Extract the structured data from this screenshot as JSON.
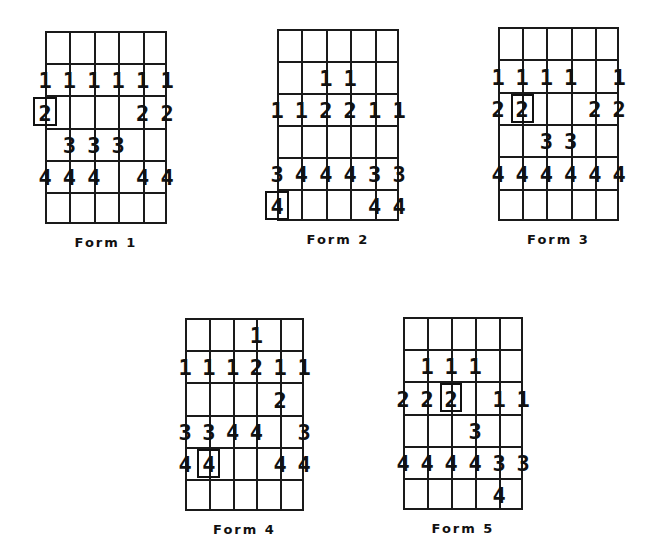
{
  "figure": {
    "columns": 5,
    "rows": 6,
    "line_color": "#1a1a1a",
    "forms": [
      {
        "id": "form-1",
        "label": "Form 1",
        "grid": {
          "x": 45,
          "y": 31,
          "width": 122,
          "height": 193
        },
        "entries": [
          {
            "row": 1,
            "pos": 0,
            "value": "1"
          },
          {
            "row": 1,
            "pos": 1,
            "value": "1"
          },
          {
            "row": 1,
            "pos": 2,
            "value": "1"
          },
          {
            "row": 1,
            "pos": 3,
            "value": "1"
          },
          {
            "row": 1,
            "pos": 4,
            "value": "1"
          },
          {
            "row": 1,
            "pos": 5,
            "value": "1"
          },
          {
            "row": 2,
            "pos": 0,
            "value": "2",
            "boxed": true
          },
          {
            "row": 2,
            "pos": 4,
            "value": "2"
          },
          {
            "row": 2,
            "pos": 5,
            "value": "2"
          },
          {
            "row": 3,
            "pos": 1,
            "value": "3"
          },
          {
            "row": 3,
            "pos": 2,
            "value": "3"
          },
          {
            "row": 3,
            "pos": 3,
            "value": "3"
          },
          {
            "row": 4,
            "pos": 0,
            "value": "4"
          },
          {
            "row": 4,
            "pos": 1,
            "value": "4"
          },
          {
            "row": 4,
            "pos": 2,
            "value": "4"
          },
          {
            "row": 4,
            "pos": 4,
            "value": "4"
          },
          {
            "row": 4,
            "pos": 5,
            "value": "4"
          }
        ]
      },
      {
        "id": "form-2",
        "label": "Form 2",
        "grid": {
          "x": 277,
          "y": 29,
          "width": 122,
          "height": 192
        },
        "entries": [
          {
            "row": 1,
            "pos": 2,
            "value": "1"
          },
          {
            "row": 1,
            "pos": 3,
            "value": "1"
          },
          {
            "row": 2,
            "pos": 0,
            "value": "1"
          },
          {
            "row": 2,
            "pos": 1,
            "value": "1"
          },
          {
            "row": 2,
            "pos": 2,
            "value": "2"
          },
          {
            "row": 2,
            "pos": 3,
            "value": "2"
          },
          {
            "row": 2,
            "pos": 4,
            "value": "1"
          },
          {
            "row": 2,
            "pos": 5,
            "value": "1"
          },
          {
            "row": 4,
            "pos": 0,
            "value": "3"
          },
          {
            "row": 4,
            "pos": 1,
            "value": "4"
          },
          {
            "row": 4,
            "pos": 2,
            "value": "4"
          },
          {
            "row": 4,
            "pos": 3,
            "value": "4"
          },
          {
            "row": 4,
            "pos": 4,
            "value": "3"
          },
          {
            "row": 4,
            "pos": 5,
            "value": "3"
          },
          {
            "row": 5,
            "pos": 0,
            "value": "4",
            "boxed": true
          },
          {
            "row": 5,
            "pos": 4,
            "value": "4"
          },
          {
            "row": 5,
            "pos": 5,
            "value": "4"
          }
        ]
      },
      {
        "id": "form-3",
        "label": "Form 3",
        "grid": {
          "x": 498,
          "y": 27,
          "width": 121,
          "height": 194
        },
        "entries": [
          {
            "row": 1,
            "pos": 0,
            "value": "1"
          },
          {
            "row": 1,
            "pos": 1,
            "value": "1"
          },
          {
            "row": 1,
            "pos": 2,
            "value": "1"
          },
          {
            "row": 1,
            "pos": 3,
            "value": "1"
          },
          {
            "row": 1,
            "pos": 5,
            "value": "1"
          },
          {
            "row": 2,
            "pos": 0,
            "value": "2"
          },
          {
            "row": 2,
            "pos": 1,
            "value": "2",
            "boxed": true
          },
          {
            "row": 2,
            "pos": 4,
            "value": "2"
          },
          {
            "row": 2,
            "pos": 5,
            "value": "2"
          },
          {
            "row": 3,
            "pos": 2,
            "value": "3"
          },
          {
            "row": 3,
            "pos": 3,
            "value": "3"
          },
          {
            "row": 4,
            "pos": 0,
            "value": "4"
          },
          {
            "row": 4,
            "pos": 1,
            "value": "4"
          },
          {
            "row": 4,
            "pos": 2,
            "value": "4"
          },
          {
            "row": 4,
            "pos": 3,
            "value": "4"
          },
          {
            "row": 4,
            "pos": 4,
            "value": "4"
          },
          {
            "row": 4,
            "pos": 5,
            "value": "4"
          }
        ]
      },
      {
        "id": "form-4",
        "label": "Form 4",
        "grid": {
          "x": 185,
          "y": 318,
          "width": 119,
          "height": 193
        },
        "entries": [
          {
            "row": 0,
            "pos": 3,
            "value": "1"
          },
          {
            "row": 1,
            "pos": 0,
            "value": "1"
          },
          {
            "row": 1,
            "pos": 1,
            "value": "1"
          },
          {
            "row": 1,
            "pos": 2,
            "value": "1"
          },
          {
            "row": 1,
            "pos": 3,
            "value": "2"
          },
          {
            "row": 1,
            "pos": 4,
            "value": "1"
          },
          {
            "row": 1,
            "pos": 5,
            "value": "1"
          },
          {
            "row": 2,
            "pos": 4,
            "value": "2"
          },
          {
            "row": 3,
            "pos": 0,
            "value": "3"
          },
          {
            "row": 3,
            "pos": 1,
            "value": "3"
          },
          {
            "row": 3,
            "pos": 2,
            "value": "4"
          },
          {
            "row": 3,
            "pos": 3,
            "value": "4"
          },
          {
            "row": 3,
            "pos": 5,
            "value": "3"
          },
          {
            "row": 4,
            "pos": 0,
            "value": "4"
          },
          {
            "row": 4,
            "pos": 1,
            "value": "4",
            "boxed": true
          },
          {
            "row": 4,
            "pos": 4,
            "value": "4"
          },
          {
            "row": 4,
            "pos": 5,
            "value": "4"
          }
        ]
      },
      {
        "id": "form-5",
        "label": "Form 5",
        "grid": {
          "x": 403,
          "y": 317,
          "width": 120,
          "height": 193
        },
        "entries": [
          {
            "row": 1,
            "pos": 1,
            "value": "1"
          },
          {
            "row": 1,
            "pos": 2,
            "value": "1"
          },
          {
            "row": 1,
            "pos": 3,
            "value": "1"
          },
          {
            "row": 2,
            "pos": 0,
            "value": "2"
          },
          {
            "row": 2,
            "pos": 1,
            "value": "2"
          },
          {
            "row": 2,
            "pos": 2,
            "value": "2",
            "boxed": true
          },
          {
            "row": 2,
            "pos": 4,
            "value": "1"
          },
          {
            "row": 2,
            "pos": 5,
            "value": "1"
          },
          {
            "row": 3,
            "pos": 3,
            "value": "3"
          },
          {
            "row": 4,
            "pos": 0,
            "value": "4"
          },
          {
            "row": 4,
            "pos": 1,
            "value": "4"
          },
          {
            "row": 4,
            "pos": 2,
            "value": "4"
          },
          {
            "row": 4,
            "pos": 3,
            "value": "4"
          },
          {
            "row": 4,
            "pos": 4,
            "value": "3"
          },
          {
            "row": 4,
            "pos": 5,
            "value": "3"
          },
          {
            "row": 5,
            "pos": 4,
            "value": "4"
          }
        ]
      }
    ]
  }
}
